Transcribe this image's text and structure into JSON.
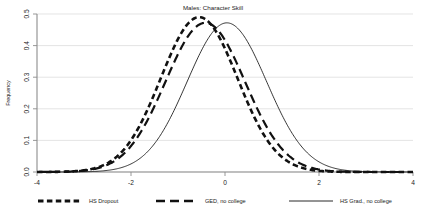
{
  "chart_data": {
    "type": "line",
    "title": "Males: Character Skill",
    "xlabel": "",
    "ylabel": "Frequency",
    "xlim": [
      -4,
      4
    ],
    "ylim": [
      0.0,
      0.5
    ],
    "xticks": [
      "-4",
      "-2",
      "0",
      "2",
      "4"
    ],
    "xtick_values": [
      -4,
      -2,
      0,
      2,
      4
    ],
    "yticks": [
      "0.0",
      "0.1",
      "0.2",
      "0.3",
      "0.4",
      "0.5"
    ],
    "ytick_values": [
      0.0,
      0.1,
      0.2,
      0.3,
      0.4,
      0.5
    ],
    "grid": "horizontal",
    "legend_position": "below",
    "series": [
      {
        "name": "HS Dropout",
        "style": "heavy-dotted",
        "color": "#111111",
        "distribution": "normal",
        "mean": -0.55,
        "sd": 0.815,
        "peak_value": 0.49,
        "x": [
          -3.5,
          -3.0,
          -2.5,
          -2.0,
          -1.5,
          -1.0,
          -0.55,
          0.0,
          0.5,
          1.0,
          1.5,
          2.0,
          2.5,
          3.0,
          3.5
        ],
        "y": [
          0.003,
          0.01,
          0.029,
          0.069,
          0.139,
          0.238,
          0.49,
          0.368,
          0.204,
          0.091,
          0.032,
          0.009,
          0.002,
          0.0,
          0.0
        ]
      },
      {
        "name": "GED, no college",
        "style": "long-dashed",
        "color": "#111111",
        "distribution": "normal",
        "mean": -0.42,
        "sd": 0.845,
        "peak_value": 0.472,
        "x": [
          -3.5,
          -3.0,
          -2.5,
          -2.0,
          -1.5,
          -1.0,
          -0.42,
          0.0,
          0.5,
          1.0,
          1.5,
          2.0,
          2.5,
          3.0,
          3.5
        ],
        "y": [
          0.002,
          0.008,
          0.025,
          0.061,
          0.126,
          0.22,
          0.472,
          0.389,
          0.231,
          0.111,
          0.043,
          0.013,
          0.003,
          0.001,
          0.0
        ]
      },
      {
        "name": "HS Grad., no college",
        "style": "thin-solid",
        "color": "#111111",
        "distribution": "normal",
        "mean": 0.04,
        "sd": 0.845,
        "peak_value": 0.472,
        "x": [
          -3.5,
          -3.0,
          -2.5,
          -2.0,
          -1.5,
          -1.0,
          -0.5,
          0.04,
          0.5,
          1.0,
          1.5,
          2.0,
          2.5,
          3.0,
          3.5
        ],
        "y": [
          0.0,
          0.001,
          0.003,
          0.01,
          0.031,
          0.082,
          0.174,
          0.472,
          0.425,
          0.303,
          0.173,
          0.079,
          0.029,
          0.008,
          0.002
        ]
      }
    ]
  },
  "legend": {
    "items": [
      {
        "label": "HS Dropout"
      },
      {
        "label": "GED, no college"
      },
      {
        "label": "HS Grad., no college"
      }
    ]
  }
}
